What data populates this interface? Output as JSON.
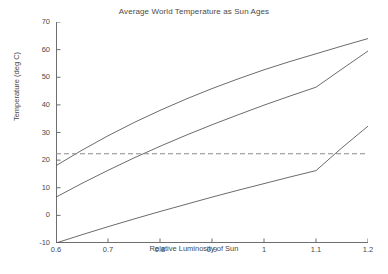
{
  "chart_data": {
    "type": "line",
    "title": "Average World Temperature as Sun Ages",
    "xlabel": "Relative Luminosity of Sun",
    "ylabel": "Temperature (deg C)",
    "xlim": [
      0.6,
      1.2
    ],
    "ylim": [
      -10,
      70
    ],
    "grid": false,
    "legend_position": "none",
    "xticks": [
      "0.6",
      "0.7",
      "0.8",
      "0.9",
      "1",
      "1.1",
      "1.2"
    ],
    "xtick_values": [
      0.6,
      0.7,
      0.8,
      0.9,
      1.0,
      1.1,
      1.2
    ],
    "yticks": [
      "-10",
      "0",
      "10",
      "20",
      "30",
      "40",
      "50",
      "60",
      "70"
    ],
    "ytick_values": [
      -10,
      0,
      10,
      20,
      30,
      40,
      50,
      60,
      70
    ],
    "line_color": "#5a5a5a",
    "series": [
      {
        "name": "upper-curve",
        "style": "solid",
        "x": [
          0.6,
          0.65,
          0.7,
          0.75,
          0.8,
          0.85,
          0.9,
          0.95,
          1.0,
          1.05,
          1.1,
          1.15,
          1.2
        ],
        "values": [
          18.0,
          23.6,
          28.8,
          33.6,
          38.0,
          42.1,
          45.9,
          49.4,
          52.7,
          55.7,
          58.5,
          61.3,
          64.0
        ]
      },
      {
        "name": "middle-curve",
        "style": "solid",
        "x": [
          0.6,
          0.65,
          0.7,
          0.75,
          0.8,
          0.85,
          0.9,
          0.95,
          1.0,
          1.05,
          1.1,
          1.15,
          1.2
        ],
        "values": [
          6.6,
          11.6,
          16.3,
          20.8,
          25.0,
          29.0,
          32.8,
          36.4,
          39.9,
          43.2,
          46.4,
          53.0,
          59.5
        ]
      },
      {
        "name": "lower-curve",
        "style": "solid",
        "x": [
          0.6,
          0.65,
          0.7,
          0.75,
          0.8,
          0.85,
          0.9,
          0.95,
          1.0,
          1.05,
          1.1,
          1.15,
          1.2
        ],
        "values": [
          -10.0,
          -7.0,
          -4.1,
          -1.3,
          1.4,
          4.0,
          6.6,
          9.1,
          11.5,
          13.9,
          16.2,
          24.5,
          32.3
        ]
      }
    ],
    "reference_line": {
      "name": "threshold-line",
      "style": "dashed",
      "orientation": "horizontal",
      "value": 22.3,
      "color": "#8a8a8a"
    }
  }
}
